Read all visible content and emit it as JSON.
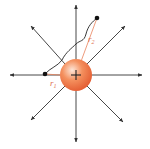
{
  "diagram": {
    "charge": {
      "symbol": "+",
      "center": [
        76,
        75
      ],
      "radius": 16,
      "colors": {
        "highlight": "#fde6d8",
        "mid": "#f4905e",
        "edge": "#e8643a"
      }
    },
    "field_lines": {
      "color": "#333333",
      "directions_deg": [
        0,
        45,
        90,
        135,
        180,
        225,
        270,
        315
      ],
      "length": 68
    },
    "points": [
      {
        "name": "point-1",
        "pos": [
          45,
          74
        ]
      },
      {
        "name": "point-2",
        "pos": [
          97,
          18
        ]
      }
    ],
    "labels": {
      "r1": {
        "main": "r",
        "sub": "1"
      },
      "r2": {
        "main": "r",
        "sub": "2"
      }
    },
    "path_color": "#222222",
    "radius_line_color": "#e8825a"
  }
}
